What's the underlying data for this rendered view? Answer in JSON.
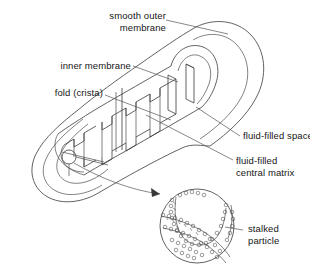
{
  "diagram": {
    "style": "black-and-white line drawing, cut-away three-dimensional view",
    "line_color": "#3a3a3a",
    "background_color": "#ffffff"
  },
  "labels": {
    "outer_membrane": {
      "line1": "smooth outer",
      "line2": "membrane"
    },
    "inner_membrane": {
      "line1": "inner membrane"
    },
    "crista": {
      "line1": "fold (crista)"
    },
    "fluid_space": {
      "line1": "fluid-filled space"
    },
    "central_matrix": {
      "line1": "fluid-filled",
      "line2": "central matrix"
    },
    "stalked_particle": {
      "line1": "stalked",
      "line2": "particle"
    }
  },
  "parts": {
    "body": "elongated capsule shown cut open",
    "inset": "magnified circular detail of membrane with stalked particles",
    "callout_marker": "small circle on inner membrane"
  }
}
